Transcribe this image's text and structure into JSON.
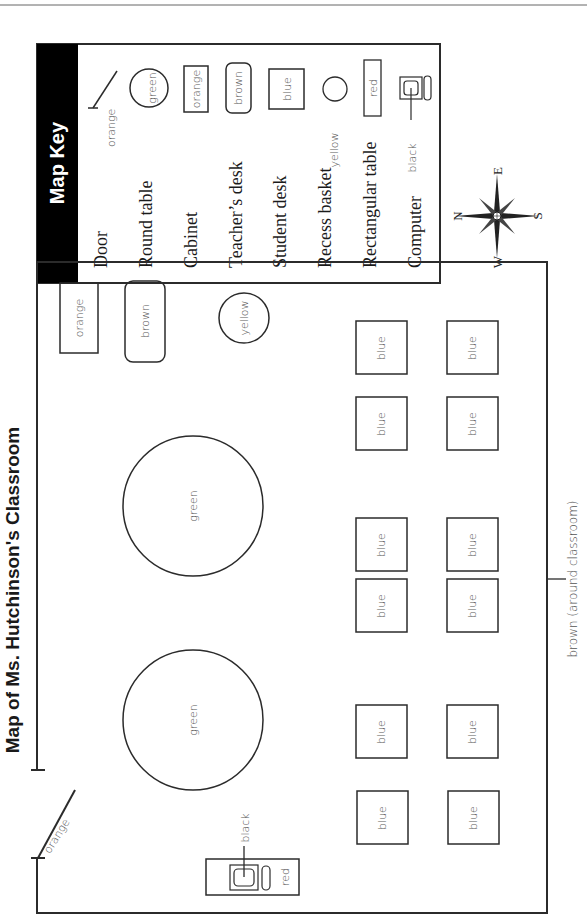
{
  "page": {
    "title": "Map of Ms. Hutchinson's Classroom",
    "orientation": "rotated-90-ccw"
  },
  "map_key": {
    "title": "Map Key",
    "items": [
      {
        "label": "Door",
        "symbol": "door-line",
        "color_label": "orange"
      },
      {
        "label": "Round table",
        "symbol": "circle",
        "color_label": "green"
      },
      {
        "label": "Cabinet",
        "symbol": "rectangle",
        "color_label": "orange"
      },
      {
        "label": "Teacher’s desk",
        "symbol": "rounded-rectangle",
        "color_label": "brown"
      },
      {
        "label": "Student desk",
        "symbol": "square",
        "color_label": "blue"
      },
      {
        "label": "Recess basket",
        "symbol": "small-circle",
        "color_label": "yellow"
      },
      {
        "label": "Rectangular table",
        "symbol": "thin-rectangle",
        "color_label": "red"
      },
      {
        "label": "Computer",
        "symbol": "computer-icon",
        "color_label": "black"
      }
    ]
  },
  "compass": {
    "north": "N",
    "south": "S",
    "east": "E",
    "west": "W"
  },
  "classroom": {
    "wall_label": "brown (around classroom)",
    "door_label": "orange",
    "cabinet_label": "orange",
    "teacher_desk_label": "brown",
    "recess_basket_label": "yellow",
    "round_tables": [
      {
        "label": "green"
      },
      {
        "label": "green"
      }
    ],
    "student_desks": [
      {
        "label": "blue"
      },
      {
        "label": "blue"
      },
      {
        "label": "blue"
      },
      {
        "label": "blue"
      },
      {
        "label": "blue"
      },
      {
        "label": "blue"
      },
      {
        "label": "blue"
      },
      {
        "label": "blue"
      },
      {
        "label": "blue"
      },
      {
        "label": "blue"
      },
      {
        "label": "blue"
      },
      {
        "label": "blue"
      }
    ],
    "rectangular_table_label": "red",
    "computer_label": "black"
  }
}
